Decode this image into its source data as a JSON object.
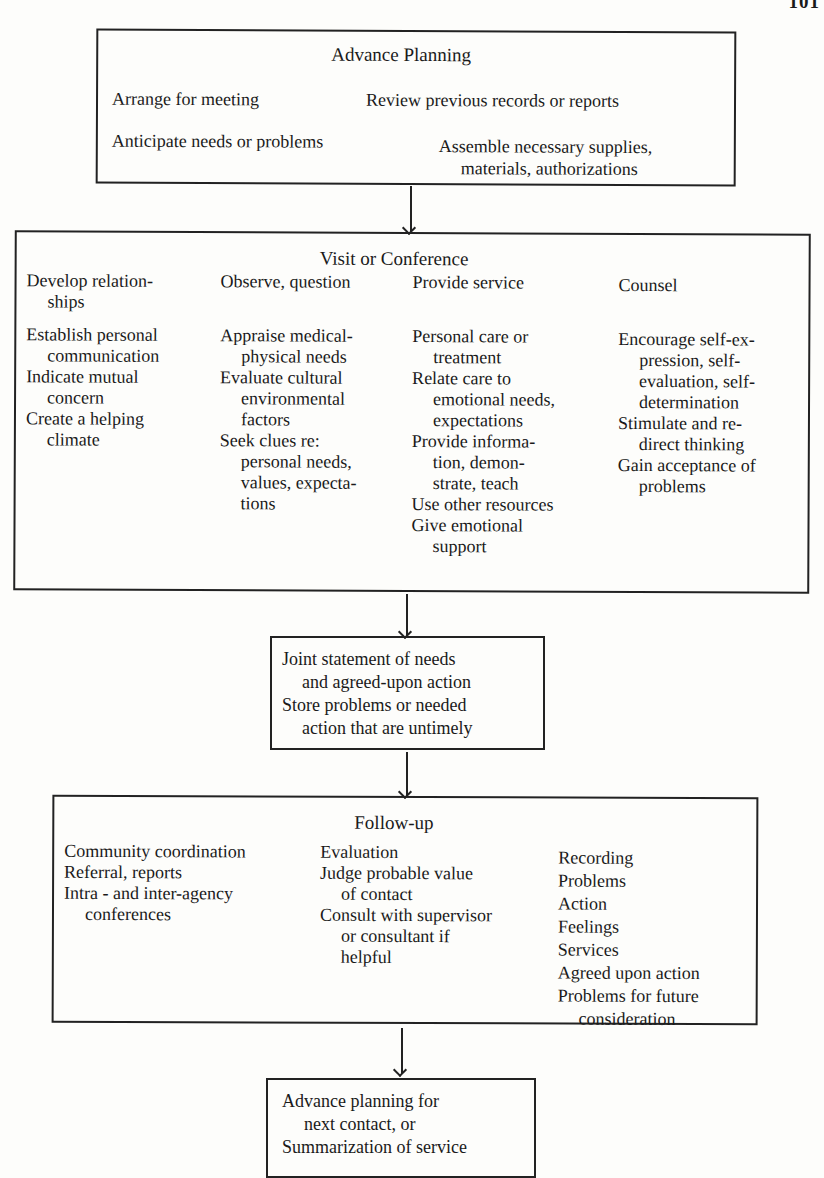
{
  "page_number": "101",
  "advance_planning": {
    "title": "Advance Planning",
    "items": [
      "Arrange for meeting",
      "Review previous records or reports",
      "Anticipate needs or problems",
      "Assemble necessary supplies,",
      "materials, authorizations"
    ]
  },
  "visit": {
    "title": "Visit or Conference",
    "columns": [
      {
        "heading": [
          "Develop relation-",
          "ships"
        ],
        "items": [
          [
            "Establish personal",
            "communication"
          ],
          [
            "Indicate mutual",
            "concern"
          ],
          [
            "Create a helping",
            "climate"
          ]
        ]
      },
      {
        "heading": [
          "Observe, question"
        ],
        "items": [
          [
            "Appraise medical-",
            "physical needs"
          ],
          [
            "Evaluate cultural",
            "environmental",
            "factors"
          ],
          [
            "Seek clues re:",
            "personal needs,",
            "values, expecta-",
            "tions"
          ]
        ]
      },
      {
        "heading": [
          "Provide service"
        ],
        "items": [
          [
            "Personal care or",
            "treatment"
          ],
          [
            "Relate care to",
            "emotional needs,",
            "expectations"
          ],
          [
            "Provide informa-",
            "tion, demon-",
            "strate, teach"
          ],
          [
            "Use other resources"
          ],
          [
            "Give emotional",
            "support"
          ]
        ]
      },
      {
        "heading": [
          "Counsel"
        ],
        "items": [
          [
            "Encourage  self-ex-",
            "pression, self-",
            "evaluation,  self-",
            "determination"
          ],
          [
            "Stimulate and re-",
            "direct thinking"
          ],
          [
            "Gain acceptance of",
            "problems"
          ]
        ]
      }
    ]
  },
  "joint": {
    "lines": [
      "Joint  statement  of  needs",
      "and agreed-upon action",
      "Store problems or needed",
      "action that are untimely"
    ]
  },
  "follow_up": {
    "title": "Follow-up",
    "col1": [
      [
        "Community coordination"
      ],
      [
        "Referral, reports"
      ],
      [
        "Intra - and inter-agency",
        "conferences"
      ]
    ],
    "col2": [
      [
        "Evaluation"
      ],
      [
        "Judge probable value",
        "of contact"
      ],
      [
        "Consult with supervisor",
        "or consultant if",
        "helpful"
      ]
    ],
    "col3": [
      [
        "Recording"
      ],
      [
        "Problems"
      ],
      [
        "Action"
      ],
      [
        "Feelings"
      ],
      [
        "Services"
      ],
      [
        "Agreed upon action"
      ],
      [
        "Problems for future",
        "consideration"
      ]
    ]
  },
  "final": {
    "lines": [
      "Advance planning for",
      "next contact, or",
      "Summarization of service"
    ]
  }
}
